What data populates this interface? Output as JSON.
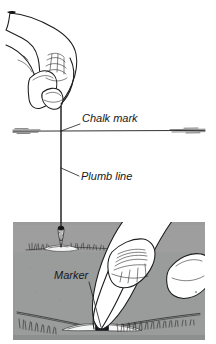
{
  "figure": {
    "background_color": "#ffffff",
    "ink_color": "#1b1c1e",
    "ground_panel_color": "#9a9b9b",
    "ground_panel_shadow_color": "#8c8d8d",
    "width": 216,
    "height": 344
  },
  "labels": [
    {
      "id": "chalk-mark",
      "text": "Chalk mark",
      "x": 82,
      "y": 122,
      "leader": {
        "from_x": 80,
        "from_y": 124,
        "to_x": 61,
        "to_y": 131
      }
    },
    {
      "id": "plumb-line",
      "text": "Plumb line",
      "x": 81,
      "y": 180,
      "leader": {
        "from_x": 79,
        "from_y": 176,
        "to_x": 61,
        "to_y": 168
      }
    },
    {
      "id": "marker",
      "text": "Marker",
      "x": 54,
      "y": 279,
      "leader": {
        "from_x": 89,
        "from_y": 282,
        "to_x": 101,
        "to_y": 327
      }
    }
  ],
  "elements": {
    "upper_hand": {
      "name": "hand-holding-string",
      "side": "left",
      "position": "top-left"
    },
    "lower_hand": {
      "name": "hand-pointing-at-marker",
      "side": "right",
      "position": "mid-right"
    },
    "plumb_string": {
      "name": "plumb-line-string",
      "top_y": 106,
      "bottom_y": 213,
      "x": 61
    },
    "plumb_bob": {
      "name": "plumb-bob-weight",
      "x": 61,
      "y": 222
    },
    "chalk_line": {
      "name": "chalk-mark-line",
      "y": 131,
      "x_start": 13,
      "x_end": 205
    },
    "ground_marker": {
      "name": "ground-marker-peg",
      "x": 101,
      "y": 328
    },
    "ground_panel": {
      "name": "ground-surface-panel",
      "x": 13,
      "y": 222,
      "width": 192,
      "height": 118
    },
    "grass_tufts": {
      "name": "grass-texture",
      "count": 2
    }
  }
}
